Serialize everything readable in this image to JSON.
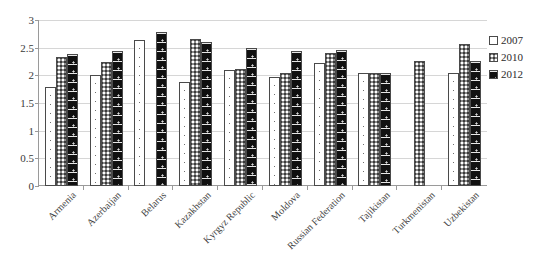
{
  "chart_data": {
    "type": "bar",
    "title": "",
    "subtitle": "",
    "xlabel": "",
    "ylabel": "",
    "ylim": [
      0,
      3
    ],
    "yticks": [
      0,
      0.5,
      1,
      1.5,
      2,
      2.5,
      3
    ],
    "ytick_labels": [
      "0",
      "0.5",
      "1",
      "1.5",
      "2",
      "2.5",
      "3"
    ],
    "grid": true,
    "legend_position": "right",
    "categories": [
      "Armenia",
      "Azerbaijan",
      "Belarus",
      "Kazakhstan",
      "Kyrgyz Republic",
      "Moldova",
      "Russian Federation",
      "Tajikistan",
      "Turkmenistan",
      "Uzbekistan"
    ],
    "series": [
      {
        "name": "2007",
        "pattern": "white-dotted",
        "values": [
          1.79,
          2.01,
          2.64,
          1.88,
          2.09,
          1.97,
          2.23,
          2.04,
          null,
          2.04
        ]
      },
      {
        "name": "2010",
        "pattern": "gray-checkered",
        "values": [
          2.33,
          2.24,
          null,
          2.66,
          2.11,
          2.05,
          2.41,
          2.05,
          2.26,
          2.56
        ]
      },
      {
        "name": "2012",
        "pattern": "black-dashed",
        "values": [
          2.39,
          2.44,
          2.79,
          2.6,
          2.5,
          2.44,
          2.45,
          2.05,
          null,
          2.26
        ]
      }
    ]
  },
  "legend": {
    "items": [
      {
        "label": "2007"
      },
      {
        "label": "2010"
      },
      {
        "label": "2012"
      }
    ]
  },
  "colors": {
    "series_2007": "#ffffff",
    "series_2010": "#8b8b8b",
    "series_2012": "#111111",
    "gridline": "#d6d6d6",
    "axis": "#9a9a9a",
    "text": "#3a3a3a",
    "background": "#ffffff"
  }
}
